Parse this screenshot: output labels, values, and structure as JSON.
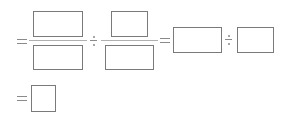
{
  "expression": {
    "line1": {
      "fraction1": {
        "numerator": "",
        "denominator": ""
      },
      "operator1": "÷",
      "fraction2": {
        "numerator": "",
        "denominator": ""
      },
      "equals2": "=",
      "blank3": "",
      "operator2": "÷",
      "blank4": ""
    },
    "line2": {
      "equals": "=",
      "answer": ""
    }
  },
  "colors": {
    "box_border": "#7a7a7a",
    "fraction_line": "#b0b0b0",
    "symbol": "#8a8a8a"
  }
}
